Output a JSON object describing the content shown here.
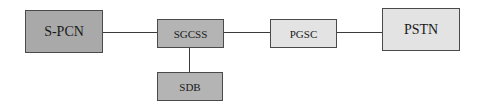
{
  "diagram": {
    "type": "network-architecture",
    "nodes": [
      {
        "id": "spcn",
        "label": "S-PCN",
        "fill": "#a9a9a9"
      },
      {
        "id": "sgcss",
        "label": "SGCSS",
        "fill": "#b4b4b4"
      },
      {
        "id": "sdb",
        "label": "SDB",
        "fill": "#b4b4b4"
      },
      {
        "id": "pgsc",
        "label": "PGSC",
        "fill": "#e3e3e3"
      },
      {
        "id": "pstn",
        "label": "PSTN",
        "fill": "#e3e3e3"
      }
    ],
    "edges": [
      {
        "from": "spcn",
        "to": "sgcss"
      },
      {
        "from": "sgcss",
        "to": "pgsc"
      },
      {
        "from": "pgsc",
        "to": "pstn"
      },
      {
        "from": "sgcss",
        "to": "sdb"
      }
    ]
  }
}
